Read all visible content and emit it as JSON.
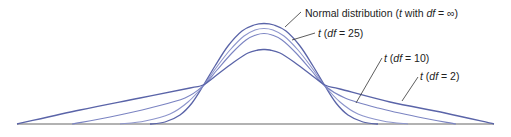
{
  "chart_data": {
    "type": "line",
    "title": "",
    "xlabel": "",
    "ylabel": "",
    "grid": false,
    "legend": "none (curves labeled directly with leader lines)",
    "axis": {
      "baseline_y": 124,
      "x_start": 17,
      "x_end": 494,
      "color": "#666666"
    },
    "center_x": 264,
    "series": [
      {
        "name": "Normal distribution (t with df = ∞)",
        "df": "∞",
        "color": "#5a64a8",
        "width": 1.3,
        "peak_y": 24,
        "points": [
          [
            150,
            124
          ],
          [
            165,
            122
          ],
          [
            180,
            115
          ],
          [
            192,
            103
          ],
          [
            203,
            86
          ],
          [
            215,
            66
          ],
          [
            228,
            46
          ],
          [
            242,
            31
          ],
          [
            254,
            25
          ],
          [
            264,
            23.5
          ],
          [
            274,
            25
          ],
          [
            286,
            31
          ],
          [
            300,
            46
          ],
          [
            313,
            66
          ],
          [
            325,
            86
          ],
          [
            336,
            103
          ],
          [
            348,
            115
          ],
          [
            363,
            122
          ],
          [
            378,
            124
          ]
        ]
      },
      {
        "name": "t (df = 25)",
        "df": 25,
        "color": "#8d95cc",
        "width": 1.1,
        "peak_y": 28,
        "points": [
          [
            120,
            124
          ],
          [
            145,
            121
          ],
          [
            170,
            114
          ],
          [
            188,
            102
          ],
          [
            203,
            86
          ],
          [
            216,
            68
          ],
          [
            230,
            50
          ],
          [
            244,
            36
          ],
          [
            255,
            30
          ],
          [
            264,
            28.5
          ],
          [
            273,
            30
          ],
          [
            284,
            36
          ],
          [
            298,
            50
          ],
          [
            312,
            68
          ],
          [
            325,
            86
          ],
          [
            340,
            102
          ],
          [
            358,
            114
          ],
          [
            383,
            121
          ],
          [
            408,
            124
          ]
        ]
      },
      {
        "name": "t (df = 10)",
        "df": 10,
        "color": "#7b84c2",
        "width": 1.1,
        "peak_y": 34,
        "points": [
          [
            72,
            124
          ],
          [
            110,
            117
          ],
          [
            150,
            108
          ],
          [
            185,
            98
          ],
          [
            203,
            86
          ],
          [
            217,
            70
          ],
          [
            232,
            53
          ],
          [
            246,
            40
          ],
          [
            256,
            35
          ],
          [
            264,
            33.5
          ],
          [
            272,
            35
          ],
          [
            282,
            40
          ],
          [
            296,
            53
          ],
          [
            311,
            70
          ],
          [
            325,
            86
          ],
          [
            345,
            98
          ],
          [
            378,
            108
          ],
          [
            418,
            117
          ],
          [
            456,
            124
          ]
        ]
      },
      {
        "name": "t (df = 2)",
        "df": 2,
        "color": "#5a64a8",
        "width": 1.3,
        "peak_y": 49,
        "points": [
          [
            17,
            124
          ],
          [
            80,
            110
          ],
          [
            140,
            98
          ],
          [
            190,
            88
          ],
          [
            203,
            85
          ],
          [
            218,
            74
          ],
          [
            234,
            62
          ],
          [
            248,
            53
          ],
          [
            258,
            50
          ],
          [
            264,
            49.5
          ],
          [
            270,
            50
          ],
          [
            280,
            53
          ],
          [
            294,
            62
          ],
          [
            310,
            74
          ],
          [
            325,
            85
          ],
          [
            340,
            89
          ],
          [
            390,
            102
          ],
          [
            445,
            113
          ],
          [
            494,
            124
          ]
        ]
      }
    ],
    "annotations": [
      {
        "text_parts": [
          "Normal distribution (",
          "t",
          " with ",
          "df",
          " = ∞)"
        ],
        "italic": [
          false,
          true,
          false,
          true,
          false
        ],
        "x": 305,
        "y": 17,
        "leader": [
          [
            285,
            27
          ],
          [
            301,
            12
          ]
        ]
      },
      {
        "text_parts": [
          "t",
          " (",
          "df",
          " = 25)"
        ],
        "italic": [
          true,
          false,
          true,
          false
        ],
        "x": 318,
        "y": 37,
        "leader": [
          [
            292,
            40
          ],
          [
            315,
            33
          ]
        ]
      },
      {
        "text_parts": [
          "t",
          " (",
          "df",
          " = 10)"
        ],
        "italic": [
          true,
          false,
          true,
          false
        ],
        "x": 384,
        "y": 62,
        "leader": [
          [
            356,
            103
          ],
          [
            382,
            58
          ]
        ]
      },
      {
        "text_parts": [
          "t",
          " (",
          "df",
          " = 2)"
        ],
        "italic": [
          true,
          false,
          true,
          false
        ],
        "x": 420,
        "y": 80,
        "leader": [
          [
            402,
            101
          ],
          [
            418,
            77
          ]
        ]
      }
    ]
  }
}
